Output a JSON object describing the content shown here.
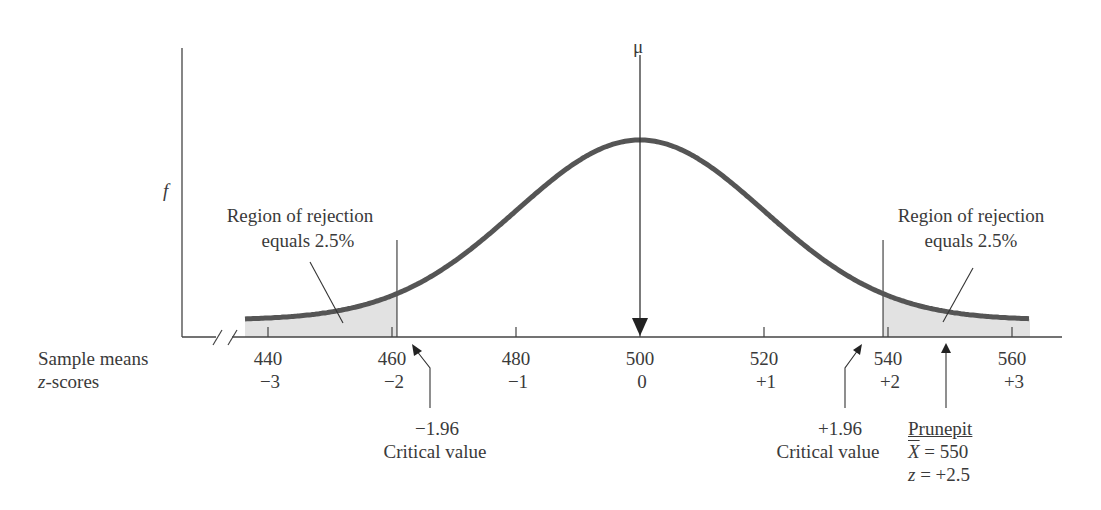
{
  "chart_data": {
    "type": "line",
    "title": "",
    "ylabel": "f",
    "xlabel_rows": [
      "Sample means",
      "z-scores"
    ],
    "mean_label": "μ",
    "mean_value": 500,
    "standard_error": 20,
    "x_ticks": [
      440,
      460,
      480,
      500,
      520,
      540,
      560
    ],
    "z_ticks": [
      "−3",
      "−2",
      "−1",
      "0",
      "+1",
      "+2",
      "+3"
    ],
    "xlim": [
      435,
      565
    ],
    "axis_break": true,
    "grid": false,
    "critical_values": [
      {
        "z": "−1.96",
        "label": "Critical value"
      },
      {
        "z": "+1.96",
        "label": "Critical value"
      }
    ],
    "rejection_regions": [
      {
        "side": "left",
        "label_line1": "Region of rejection",
        "label_line2": "equals 2.5%"
      },
      {
        "side": "right",
        "label_line1": "Region of rejection",
        "label_line2": "equals 2.5%"
      }
    ],
    "sample_point": {
      "name": "Prunepit",
      "xbar_label": "X",
      "xbar_value": "= 550",
      "z_label": "z",
      "z_value": "= +2.5"
    }
  },
  "colors": {
    "curve": "#555555",
    "axis": "#444444",
    "shade": "#e2e2e2",
    "text": "#3a3a3a"
  }
}
